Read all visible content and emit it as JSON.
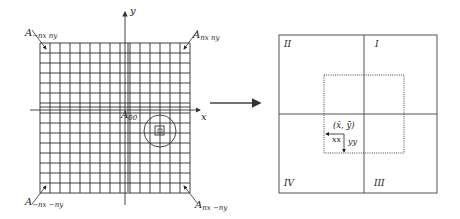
{
  "left_panel": {
    "grid": {
      "columns": 15,
      "rows": 15,
      "x0": 40,
      "y0": 43,
      "cell": 10
    },
    "axes": {
      "x_label": "x",
      "y_label": "y"
    },
    "origin_label": {
      "main": "A",
      "sub": "00"
    },
    "corner_labels": {
      "top_left": {
        "main": "A",
        "sub": "−nx ny"
      },
      "top_right": {
        "main": "A",
        "sub": "nx ny"
      },
      "bottom_left": {
        "main": "A",
        "sub": "−nx −ny"
      },
      "bottom_right": {
        "main": "A",
        "sub": "nx −ny"
      }
    }
  },
  "arrow": {
    "direction": "right"
  },
  "right_panel": {
    "quadrants": {
      "q1": "I",
      "q2": "II",
      "q3": "III",
      "q4": "IV"
    },
    "centroid_label": "(x̄, ȳ)",
    "xx_label": "xx",
    "yy_label": "yy"
  },
  "colors": {
    "line": "#2a2a2a",
    "box": "#555555",
    "background": "#ffffff"
  }
}
